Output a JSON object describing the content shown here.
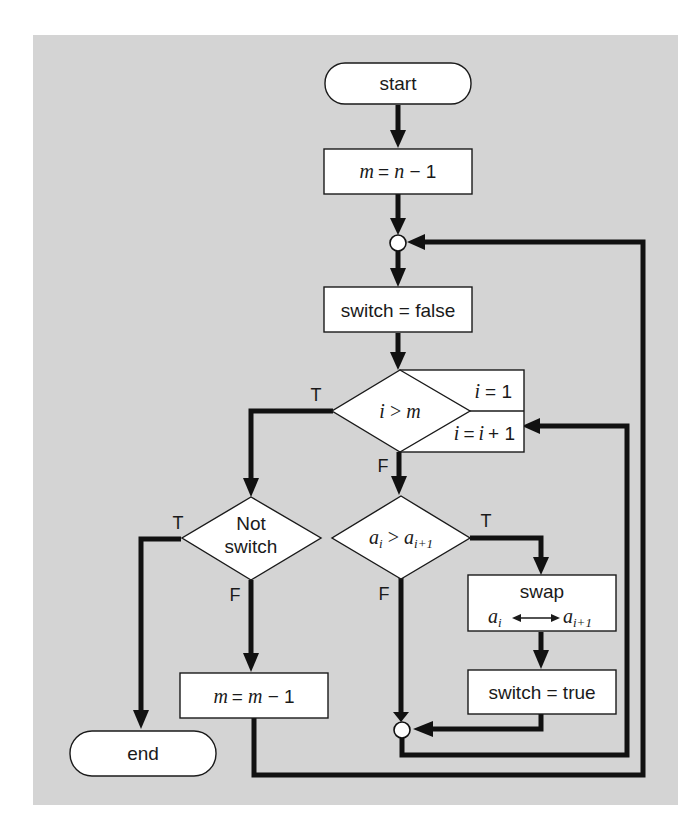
{
  "diagram": {
    "type": "flowchart",
    "background_color": "#d4d4d4",
    "nodes": {
      "start": {
        "label": "start",
        "shape": "terminal"
      },
      "init_m": {
        "label_left": "m",
        "label_mid": "= ",
        "label_var": "n",
        "label_right": " − 1",
        "full": "m = n − 1",
        "shape": "process"
      },
      "switch_false": {
        "label": "switch = false",
        "shape": "process"
      },
      "loop_test": {
        "label": "i > m",
        "shape": "decision"
      },
      "loop_init": {
        "label": "i = 1",
        "shape": "loop-init"
      },
      "loop_incr": {
        "label": "i = i + 1",
        "shape": "loop-increment"
      },
      "compare": {
        "label_a": "a",
        "label_i": "i",
        "label_op": " > ",
        "label_b": "a",
        "label_ip1": "i+1",
        "full": "a_i > a_{i+1}",
        "shape": "decision"
      },
      "swap": {
        "label": "swap",
        "left": "a",
        "left_sub": "i",
        "right": "a",
        "right_sub": "i+1",
        "full": "swap a_i ↔ a_{i+1}",
        "shape": "process"
      },
      "switch_true": {
        "label": "switch = true",
        "shape": "process"
      },
      "not_switch": {
        "label_line1": "Not",
        "label_line2": "switch",
        "full": "Not switch",
        "shape": "decision"
      },
      "decrement_m": {
        "full": "m = m − 1",
        "left": "m",
        "mid": " = ",
        "var": "m",
        "right": " − 1",
        "shape": "process"
      },
      "end": {
        "label": "end",
        "shape": "terminal"
      }
    },
    "branch_labels": {
      "loop_test_true": "T",
      "loop_test_false": "F",
      "compare_true": "T",
      "compare_false": "F",
      "not_switch_true": "T",
      "not_switch_false": "F"
    },
    "edges": [
      {
        "from": "start",
        "to": "init_m"
      },
      {
        "from": "init_m",
        "to": "junction_top"
      },
      {
        "from": "junction_top",
        "to": "switch_false"
      },
      {
        "from": "switch_false",
        "to": "loop_test"
      },
      {
        "from": "loop_test",
        "to": "not_switch",
        "label": "T"
      },
      {
        "from": "loop_test",
        "to": "compare",
        "label": "F"
      },
      {
        "from": "compare",
        "to": "swap",
        "label": "T"
      },
      {
        "from": "compare",
        "to": "junction_bottom",
        "label": "F"
      },
      {
        "from": "swap",
        "to": "switch_true"
      },
      {
        "from": "switch_true",
        "to": "junction_bottom"
      },
      {
        "from": "junction_bottom",
        "to": "loop_incr"
      },
      {
        "from": "not_switch",
        "to": "end",
        "label": "T"
      },
      {
        "from": "not_switch",
        "to": "decrement_m",
        "label": "F"
      },
      {
        "from": "decrement_m",
        "to": "junction_top"
      }
    ]
  }
}
